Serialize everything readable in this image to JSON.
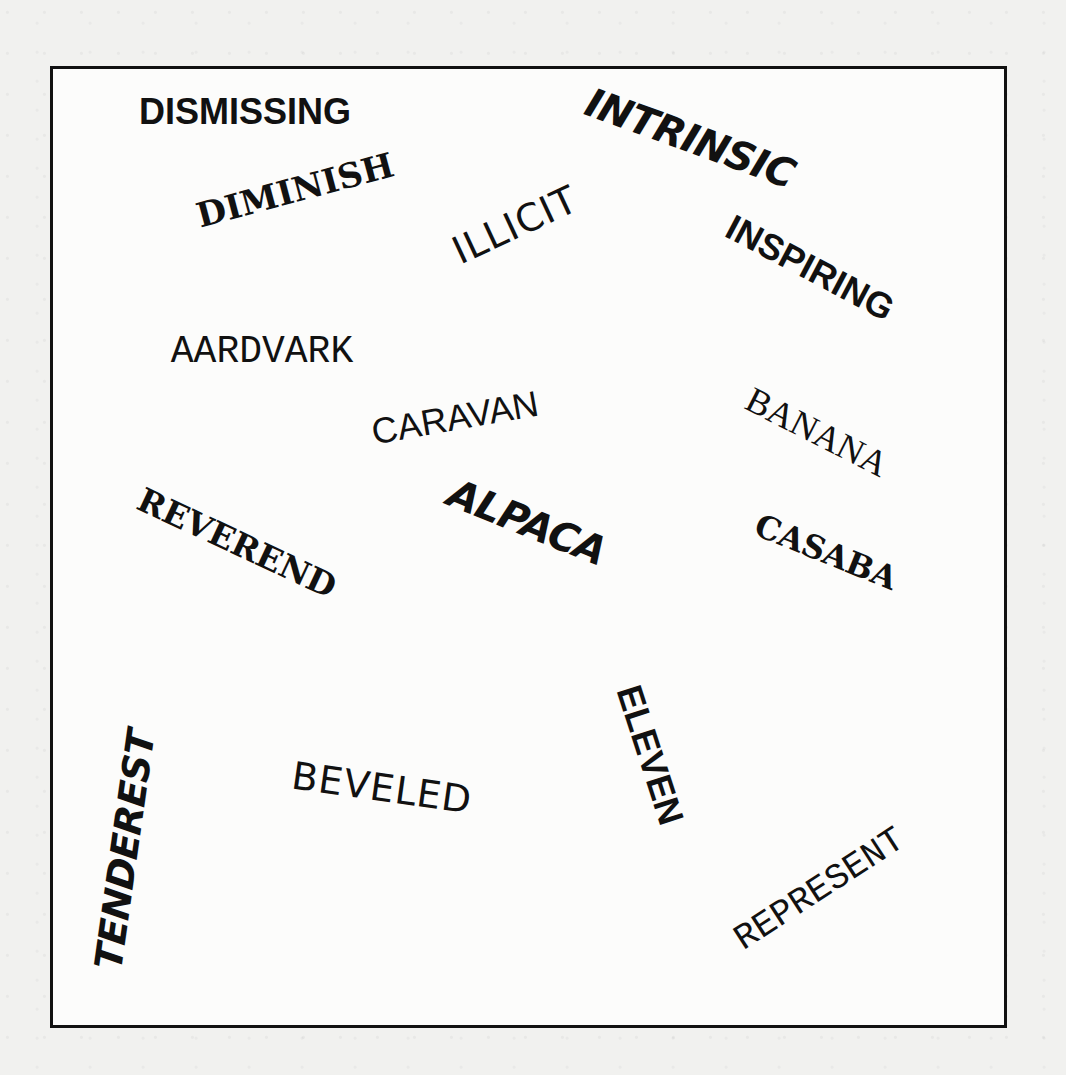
{
  "page": {
    "background": "#f1f1ef",
    "frame_border_color": "#111111",
    "text_color": "#111111"
  },
  "words": [
    {
      "id": "dismissing",
      "text": "DISMISSING",
      "style": "sans-bold",
      "x": 245,
      "y": 112,
      "size": 36,
      "rotate": 0
    },
    {
      "id": "diminish",
      "text": "DIMINISH",
      "style": "serif-bold",
      "x": 295,
      "y": 190,
      "size": 34,
      "rotate": -15
    },
    {
      "id": "intrinsic",
      "text": "INTRINSIC",
      "style": "brush",
      "x": 690,
      "y": 138,
      "size": 40,
      "rotate": 20
    },
    {
      "id": "illicit",
      "text": "ILLICIT",
      "style": "sans-thin",
      "x": 515,
      "y": 225,
      "size": 38,
      "rotate": -25
    },
    {
      "id": "inspiring",
      "text": "INSPIRING",
      "style": "sans-bold",
      "x": 810,
      "y": 268,
      "size": 36,
      "rotate": 28
    },
    {
      "id": "aardvark",
      "text": "AARDVARK",
      "style": "mono",
      "x": 262,
      "y": 352,
      "size": 38,
      "rotate": 0
    },
    {
      "id": "caravan",
      "text": "CARAVAN",
      "style": "sans",
      "x": 455,
      "y": 418,
      "size": 36,
      "rotate": -10
    },
    {
      "id": "banana",
      "text": "BANANA",
      "style": "serif",
      "x": 817,
      "y": 432,
      "size": 36,
      "rotate": 27
    },
    {
      "id": "alpaca",
      "text": "ALPACA",
      "style": "brush",
      "x": 527,
      "y": 522,
      "size": 40,
      "rotate": 22
    },
    {
      "id": "reverend",
      "text": "REVEREND",
      "style": "serif-bold",
      "x": 237,
      "y": 543,
      "size": 33,
      "rotate": 25
    },
    {
      "id": "casaba",
      "text": "CASABA",
      "style": "serif-bold",
      "x": 826,
      "y": 552,
      "size": 32,
      "rotate": 22
    },
    {
      "id": "eleven",
      "text": "ELEVEN",
      "style": "sans-bold",
      "x": 650,
      "y": 755,
      "size": 36,
      "rotate": 72
    },
    {
      "id": "beveled",
      "text": "BEVELED",
      "style": "sans-thin",
      "x": 382,
      "y": 788,
      "size": 38,
      "rotate": 8
    },
    {
      "id": "tenderest",
      "text": "TENDEREST",
      "style": "brush",
      "x": 125,
      "y": 850,
      "size": 38,
      "rotate": -82
    },
    {
      "id": "represent",
      "text": "REPRESENT",
      "style": "mono",
      "x": 820,
      "y": 890,
      "size": 36,
      "rotate": -33
    }
  ]
}
